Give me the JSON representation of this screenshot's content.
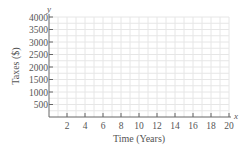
{
  "chart_data": {
    "type": "line",
    "title": "",
    "xlabel": "Time (Years)",
    "ylabel": "Taxes ($)",
    "x_axis_variable": "x",
    "y_axis_variable": "y",
    "xlim": [
      0,
      20
    ],
    "ylim": [
      0,
      4000
    ],
    "x_ticks": [
      2,
      4,
      6,
      8,
      10,
      12,
      14,
      16,
      18,
      20
    ],
    "y_ticks": [
      500,
      1000,
      1500,
      2000,
      2500,
      3000,
      3500,
      4000
    ],
    "grid": true,
    "series": [],
    "legend": null
  },
  "labels": {
    "xlabel": "Time (Years)",
    "ylabel": "Taxes ($)",
    "x_var": "x",
    "y_var": "y"
  }
}
